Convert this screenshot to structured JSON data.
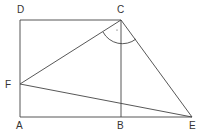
{
  "points": {
    "A": {
      "label": "A",
      "x": 20,
      "y": 117
    },
    "B": {
      "label": "B",
      "x": 121,
      "y": 117
    },
    "C": {
      "label": "C",
      "x": 121,
      "y": 20
    },
    "D": {
      "label": "D",
      "x": 20,
      "y": 20
    },
    "E": {
      "label": "E",
      "x": 192,
      "y": 117
    },
    "F": {
      "label": "F",
      "x": 20,
      "y": 84
    }
  },
  "labels": {
    "A": "A",
    "B": "B",
    "C": "C",
    "D": "D",
    "E": "E",
    "F": "F"
  },
  "segments": [
    "AD",
    "DC",
    "CB",
    "AE",
    "CF",
    "CE",
    "FE"
  ],
  "angle_marker": {
    "vertex": "C",
    "between": [
      "CF",
      "CE"
    ]
  }
}
